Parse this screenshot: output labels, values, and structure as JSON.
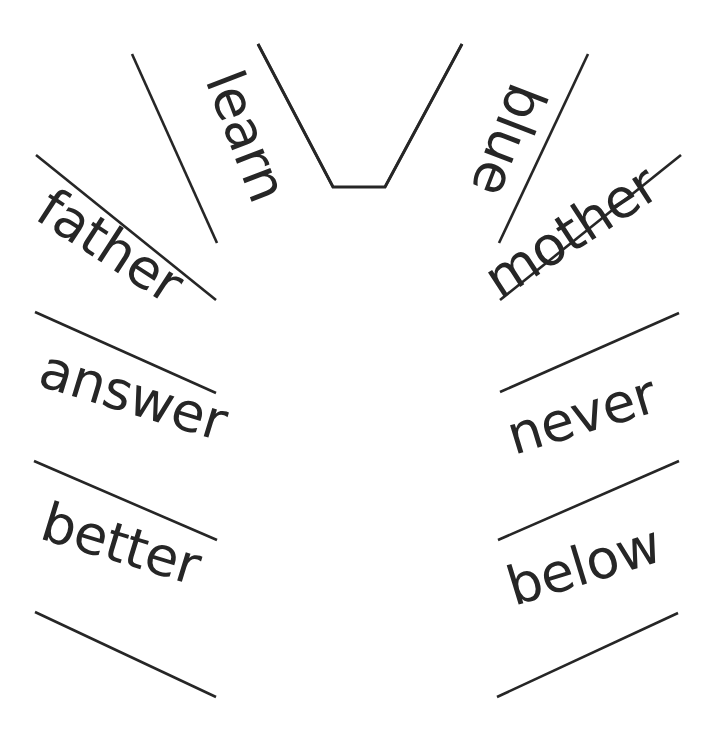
{
  "figure": {
    "background_color": "#ffffff",
    "ink_color": "#262626",
    "center": {
      "x": 358,
      "y": 600
    },
    "hub": {
      "name": "center-funnel",
      "shape": "v-funnel",
      "points": "258,44 333,187 385,187 462,44"
    }
  },
  "rays": [
    {
      "name": "ray-1",
      "x1": 258,
      "y1": 44,
      "x2": 333,
      "y2": 187
    },
    {
      "name": "ray-2",
      "x1": 132,
      "y1": 54,
      "x2": 217,
      "y2": 243
    },
    {
      "name": "ray-3",
      "x1": 36,
      "y1": 155,
      "x2": 216,
      "y2": 300
    },
    {
      "name": "ray-4",
      "x1": 35,
      "y1": 312,
      "x2": 216,
      "y2": 393
    },
    {
      "name": "ray-5",
      "x1": 34,
      "y1": 461,
      "x2": 217,
      "y2": 540
    },
    {
      "name": "ray-6",
      "x1": 35,
      "y1": 612,
      "x2": 216,
      "y2": 697
    },
    {
      "name": "ray-7",
      "x1": 462,
      "y1": 44,
      "x2": 385,
      "y2": 187
    },
    {
      "name": "ray-8",
      "x1": 588,
      "y1": 54,
      "x2": 499,
      "y2": 243
    },
    {
      "name": "ray-9",
      "x1": 681,
      "y1": 155,
      "x2": 500,
      "y2": 300
    },
    {
      "name": "ray-10",
      "x1": 679,
      "y1": 313,
      "x2": 500,
      "y2": 392
    },
    {
      "name": "ray-11",
      "x1": 679,
      "y1": 461,
      "x2": 498,
      "y2": 540
    },
    {
      "name": "ray-12",
      "x1": 678,
      "y1": 613,
      "x2": 497,
      "y2": 697
    }
  ],
  "words": [
    {
      "id": "learn",
      "label": "learn",
      "x": 205,
      "y": 80,
      "rotate": 69,
      "anchor": "start",
      "size": 54
    },
    {
      "id": "father",
      "label": "father",
      "x": 33,
      "y": 218,
      "rotate": 33,
      "anchor": "start",
      "size": 58
    },
    {
      "id": "answer",
      "label": "answer",
      "x": 36,
      "y": 385,
      "rotate": 17,
      "anchor": "start",
      "size": 58
    },
    {
      "id": "better",
      "label": "better",
      "x": 38,
      "y": 538,
      "rotate": 17,
      "anchor": "start",
      "size": 58
    },
    {
      "id": "blue",
      "label": "blue",
      "x": 512,
      "y": 80,
      "rotate": 111,
      "anchor": "start",
      "size": 54
    },
    {
      "id": "mother",
      "label": "mother",
      "x": 500,
      "y": 300,
      "rotate": -33,
      "anchor": "start",
      "size": 58
    },
    {
      "id": "never",
      "label": "never",
      "x": 514,
      "y": 455,
      "rotate": -17,
      "anchor": "start",
      "size": 58
    },
    {
      "id": "below",
      "label": "below",
      "x": 514,
      "y": 606,
      "rotate": -17,
      "anchor": "start",
      "size": 58
    }
  ]
}
